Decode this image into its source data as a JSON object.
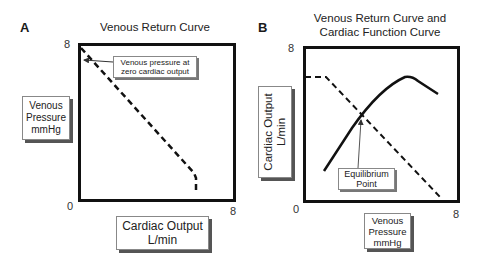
{
  "panel_a": {
    "letter": "A",
    "title": "Venous Return Curve",
    "y_axis": {
      "label_lines": [
        "Venous",
        "Pressure",
        "mmHg"
      ],
      "max": "8",
      "min": "0"
    },
    "x_axis": {
      "label_lines": [
        "Cardiac Output",
        "L/min"
      ],
      "max": "8"
    },
    "callout": {
      "lines": [
        "Venous pressure at",
        "zero cardiac output"
      ]
    }
  },
  "panel_b": {
    "letter": "B",
    "title_lines": [
      "Venous Return Curve and",
      "Cardiac Function Curve"
    ],
    "y_axis": {
      "label_lines": [
        "Cardiac Output",
        "L/min"
      ],
      "max": "8",
      "min": "0"
    },
    "x_axis": {
      "label_lines": [
        "Venous",
        "Pressure",
        "mmHg"
      ],
      "max": "8"
    },
    "callout": {
      "lines": [
        "Equilibrium",
        "Point"
      ]
    }
  },
  "curves": {
    "venous_return_style": "dashed",
    "cardiac_function_style": "solid"
  }
}
